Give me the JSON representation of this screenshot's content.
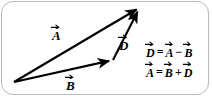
{
  "figure": {
    "type": "vector-diagram",
    "background_color": "#ffffff",
    "stroke_color": "#000000",
    "border_color": "#b9b9b9",
    "vectors": [
      {
        "name": "A",
        "label": "A",
        "accent": "arrow-overbar",
        "from": [
          14,
          82
        ],
        "to": [
          140,
          7
        ]
      },
      {
        "name": "B",
        "label": "B",
        "accent": "arrow-overbar",
        "from": [
          14,
          82
        ],
        "to": [
          113,
          60
        ]
      },
      {
        "name": "D",
        "label": "D",
        "accent": "arrow-overbar",
        "from": [
          113,
          60
        ],
        "to": [
          140,
          7
        ]
      }
    ],
    "equations": [
      {
        "id": "difference",
        "text": "D = A - B",
        "lhs": "D",
        "operator_1": "=",
        "rhs_1": "A",
        "operator_2": "−",
        "rhs_2": "B"
      },
      {
        "id": "sum",
        "text": "A = B + D",
        "lhs": "A",
        "operator_1": "=",
        "rhs_1": "B",
        "operator_2": "+",
        "rhs_2": "D"
      }
    ]
  }
}
